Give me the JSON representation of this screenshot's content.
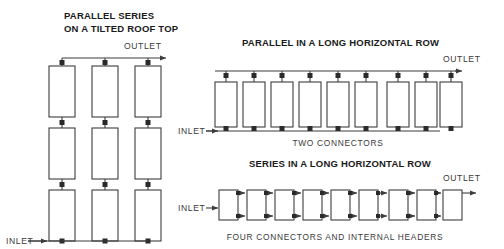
{
  "figure": {
    "background_color": "#ffffff",
    "line_color": "#3d3d3d",
    "text_color": "#3a3a3a",
    "title_color": "#1a1a1a",
    "width": 504,
    "height": 249
  },
  "diagrams": [
    {
      "id": "parallel-series-tilted-roof",
      "title_line1": "PARALLEL SERIES",
      "title_line2": "ON A TILTED ROOF TOP",
      "outlet_label": "OUTLET",
      "inlet_label": "INLET",
      "caption": "",
      "layout": "grid",
      "columns": 3,
      "rows": 3,
      "panel_count": 9,
      "connector_type": "vertical-risers",
      "outlet_position": "top-right",
      "inlet_position": "bottom-left"
    },
    {
      "id": "parallel-long-horizontal-row",
      "title_line1": "PARALLEL IN A LONG HORIZONTAL ROW",
      "title_line2": "",
      "outlet_label": "OUTLET",
      "inlet_label": "INLET",
      "caption": "TWO CONNECTORS",
      "layout": "row",
      "columns": 9,
      "rows": 1,
      "panel_count": 9,
      "connector_type": "top-and-bottom-manifold",
      "outlet_position": "top-right",
      "inlet_position": "bottom-left"
    },
    {
      "id": "series-long-horizontal-row",
      "title_line1": "SERIES IN A LONG HORIZONTAL ROW",
      "title_line2": "",
      "outlet_label": "OUTLET",
      "inlet_label": "INLET",
      "caption": "FOUR CONNECTORS AND INTERNAL HEADERS",
      "layout": "row",
      "columns": 9,
      "rows": 1,
      "panel_count": 9,
      "connector_type": "paired-horizontal-jumpers",
      "outlet_position": "right",
      "inlet_position": "left"
    }
  ]
}
